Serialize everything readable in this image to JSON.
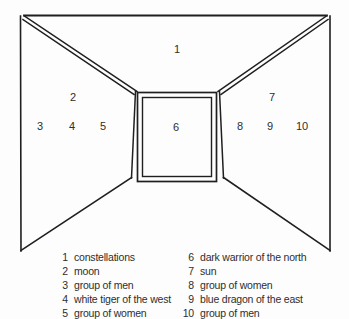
{
  "diagram": {
    "regions": [
      {
        "number": "1",
        "label": "constellations"
      },
      {
        "number": "2",
        "label": "moon"
      },
      {
        "number": "3",
        "label": "group of men"
      },
      {
        "number": "4",
        "label": "white tiger of the west"
      },
      {
        "number": "5",
        "label": "group of women"
      },
      {
        "number": "6",
        "label": "dark warrior of the north"
      },
      {
        "number": "7",
        "label": "sun"
      },
      {
        "number": "8",
        "label": "group of women"
      },
      {
        "number": "9",
        "label": "blue dragon of the east"
      },
      {
        "number": "10",
        "label": "group of men"
      }
    ]
  },
  "colors": {
    "line": "#1f1f1f",
    "text": "#2e2e2e",
    "background": "#fdfdfd"
  }
}
